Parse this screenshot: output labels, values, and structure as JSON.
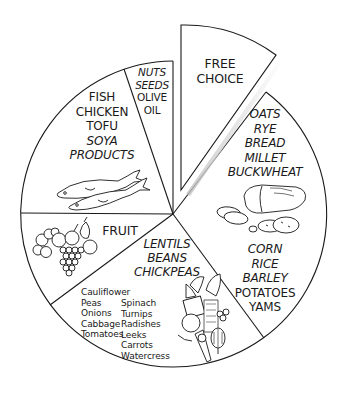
{
  "diagram": {
    "type": "pie-food-guide",
    "center": [
      173,
      214
    ],
    "radius": 153,
    "line_color": "#1a1a1a",
    "background": "#ffffff",
    "segments": [
      {
        "id": "free-choice",
        "exploded": true,
        "lines": [
          {
            "text": "FREE",
            "italic": false
          },
          {
            "text": "CHOICE",
            "italic": false
          }
        ]
      },
      {
        "id": "grains",
        "upper_lines": [
          {
            "text": "OATS",
            "italic": true
          },
          {
            "text": "RYE",
            "italic": true
          },
          {
            "text": "BREAD",
            "italic": true
          },
          {
            "text": "MILLET",
            "italic": true
          },
          {
            "text": "BUCKWHEAT",
            "italic": true
          }
        ],
        "lower_lines": [
          {
            "text": "CORN",
            "italic": true
          },
          {
            "text": "RICE",
            "italic": true
          },
          {
            "text": "BARLEY",
            "italic": true
          },
          {
            "text": "POTATOES",
            "italic": false
          },
          {
            "text": "YAMS",
            "italic": false
          }
        ],
        "illustration": "bread-and-potatoes-icon"
      },
      {
        "id": "vegetables-legumes",
        "legume_lines": [
          {
            "text": "LENTILS",
            "italic": true
          },
          {
            "text": "BEANS",
            "italic": true
          },
          {
            "text": "CHICKPEAS",
            "italic": true
          }
        ],
        "vegetables_col1": [
          "Cauliflower",
          "Peas",
          "Onions",
          "Cabbage",
          "Tomatoes"
        ],
        "vegetables_col2": [
          "Spinach",
          "Turnips",
          "Radishes",
          "Leeks",
          "Carrots",
          "Watercress"
        ],
        "illustration": "vegetables-icon"
      },
      {
        "id": "fruit",
        "lines": [
          {
            "text": "FRUIT",
            "italic": false
          }
        ],
        "illustration": "fruit-icon"
      },
      {
        "id": "protein",
        "lines": [
          {
            "text": "FISH",
            "italic": false
          },
          {
            "text": "CHICKEN",
            "italic": false
          },
          {
            "text": "TOFU",
            "italic": false
          },
          {
            "text": "SOYA",
            "italic": true
          },
          {
            "text": "PRODUCTS",
            "italic": true
          }
        ],
        "illustration": "fish-icon"
      },
      {
        "id": "nuts-oils",
        "lines": [
          {
            "text": "NUTS",
            "italic": true
          },
          {
            "text": "SEEDS",
            "italic": true
          },
          {
            "text": "OLIVE",
            "italic": false
          },
          {
            "text": "OIL",
            "italic": false
          }
        ]
      }
    ]
  }
}
